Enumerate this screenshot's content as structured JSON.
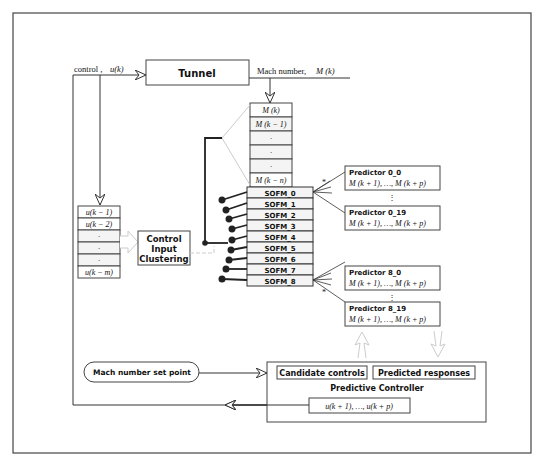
{
  "diagram": {
    "tunnel": {
      "label": "Tunnel"
    },
    "control_input": {
      "prefix": "control ,",
      "var": "u(k)"
    },
    "mach_output": {
      "prefix": "Mach number,",
      "var": "M (k)"
    },
    "mach_history": [
      "M (k)",
      "M (k − 1)",
      "·",
      "·",
      "·",
      "M (k − n)"
    ],
    "control_history": [
      "u(k − 1)",
      "u(k − 2)",
      "·",
      "·",
      "·",
      "u(k − m)"
    ],
    "clustering": {
      "lines": [
        "Control",
        "Input",
        "Clustering"
      ]
    },
    "sofm": [
      "SOFM_0",
      "SOFM_1",
      "SOFM_2",
      "SOFM_3",
      "SOFM_4",
      "SOFM_5",
      "SOFM_6",
      "SOFM_7",
      "SOFM_8"
    ],
    "predictors": [
      {
        "title": "Predictor 0_0",
        "formula": "M (k + 1), …, M (k + p)"
      },
      {
        "title": "Predictor 0_19",
        "formula": "M (k + 1), …, M (k + p)"
      },
      {
        "title": "Predictor 8_0",
        "formula": "M (k + 1), …, M (k + p)"
      },
      {
        "title": "Predictor 8_19",
        "formula": "M (k + 1), …, M (k + p)"
      }
    ],
    "ellipsis_vertical": "⋮",
    "star": "*",
    "setpoint": {
      "label": "Mach number set point"
    },
    "controller": {
      "title": "Predictive Controller",
      "candidate": "Candidate controls",
      "predicted": "Predicted responses",
      "output": "u(k + 1), …, u(k + p)"
    }
  }
}
